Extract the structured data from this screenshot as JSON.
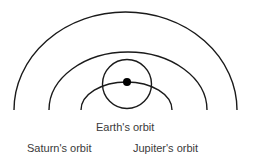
{
  "diagram": {
    "type": "orbit-diagram",
    "labels": {
      "earth": "Earth's orbit",
      "saturn": "Saturn's orbit",
      "jupiter": "Jupiter's orbit"
    },
    "colors": {
      "line": "#1a1a1a",
      "text": "#3a3a3a",
      "background": "#ffffff"
    },
    "elements": [
      {
        "name": "saturn-orbit-arc",
        "kind": "semi-arc",
        "outermost": true
      },
      {
        "name": "jupiter-orbit-arc",
        "kind": "semi-arc"
      },
      {
        "name": "earth-orbit-arc",
        "kind": "semi-arc",
        "innermost": true
      },
      {
        "name": "small-circle",
        "kind": "circle",
        "centered_on": "planet-dot"
      },
      {
        "name": "planet-dot",
        "kind": "filled-dot",
        "on": "earth-orbit-arc"
      }
    ]
  }
}
